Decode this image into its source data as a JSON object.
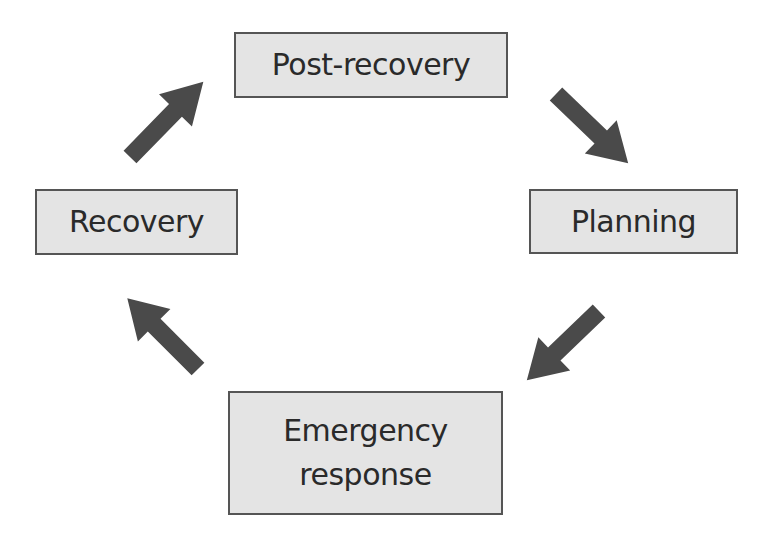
{
  "diagram": {
    "type": "cycle",
    "nodes": [
      {
        "id": "post-recovery",
        "label": "Post-recovery"
      },
      {
        "id": "planning",
        "label": "Planning"
      },
      {
        "id": "emergency-response",
        "label_lines": [
          "Emergency",
          "response"
        ]
      },
      {
        "id": "recovery",
        "label": "Recovery"
      }
    ],
    "edges": [
      {
        "from": "post-recovery",
        "to": "planning"
      },
      {
        "from": "planning",
        "to": "emergency-response"
      },
      {
        "from": "emergency-response",
        "to": "recovery"
      },
      {
        "from": "recovery",
        "to": "post-recovery"
      }
    ],
    "colors": {
      "box_fill": "#e4e4e4",
      "box_border": "#555555",
      "arrow": "#4a4a4a",
      "text": "#2a2a2a"
    }
  }
}
